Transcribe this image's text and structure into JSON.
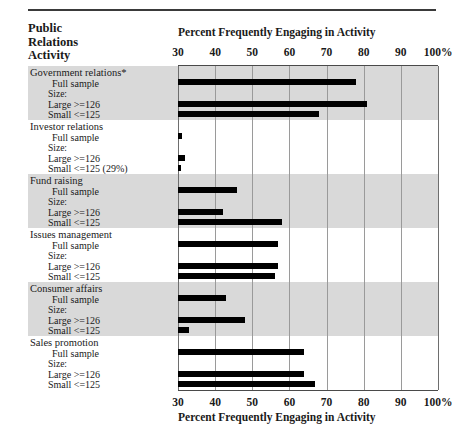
{
  "header": {
    "row_header_line1": "Public",
    "row_header_line2": "Relations",
    "row_header_line3": "Activity",
    "axis_title_top": "Percent Frequently Engaging in Activity",
    "axis_title_bottom": "Percent Frequently Engaging in Activity"
  },
  "labels": {
    "full_sample": "Full sample",
    "size_heading": "Size:",
    "large": "Large  >=126",
    "small": "Small  <=125",
    "small_annotated": "Small  <=125 (29%)"
  },
  "chart_data": {
    "type": "bar",
    "orientation": "horizontal",
    "title": "Percent Frequently Engaging in Activity",
    "xlabel": "Percent Frequently Engaging in Activity",
    "ylabel": "Public Relations Activity",
    "xlim": [
      30,
      100
    ],
    "xticks": [
      30,
      40,
      50,
      60,
      70,
      80,
      90,
      100
    ],
    "xtick_labels": [
      "30",
      "40",
      "50",
      "60",
      "70",
      "80",
      "90",
      "100%"
    ],
    "grid": true,
    "legend": false,
    "groups": [
      {
        "name": "Government relations*",
        "shaded": true,
        "bars": [
          {
            "label": "Full sample",
            "value": 78
          },
          {
            "label": "Large  >=126",
            "value": 81
          },
          {
            "label": "Small  <=125",
            "value": 68
          }
        ]
      },
      {
        "name": "Investor relations",
        "shaded": false,
        "bars": [
          {
            "label": "Full sample",
            "value": 31
          },
          {
            "label": "Large  >=126",
            "value": 32
          },
          {
            "label": "Small  <=125 (29%)",
            "value": 29,
            "annotation": "(29%)"
          }
        ]
      },
      {
        "name": "Fund raising",
        "shaded": true,
        "bars": [
          {
            "label": "Full sample",
            "value": 46
          },
          {
            "label": "Large  >=126",
            "value": 42
          },
          {
            "label": "Small  <=125",
            "value": 58
          }
        ]
      },
      {
        "name": "Issues management",
        "shaded": false,
        "bars": [
          {
            "label": "Full sample",
            "value": 57
          },
          {
            "label": "Large  >=126",
            "value": 57
          },
          {
            "label": "Small  <=125",
            "value": 56
          }
        ]
      },
      {
        "name": "Consumer affairs",
        "shaded": true,
        "bars": [
          {
            "label": "Full sample",
            "value": 43
          },
          {
            "label": "Large  >=126",
            "value": 48
          },
          {
            "label": "Small  <=125",
            "value": 33
          }
        ]
      },
      {
        "name": "Sales promotion",
        "shaded": false,
        "bars": [
          {
            "label": "Full sample",
            "value": 64
          },
          {
            "label": "Large  >=126",
            "value": 64
          },
          {
            "label": "Small  <=125",
            "value": 67
          }
        ]
      }
    ]
  }
}
